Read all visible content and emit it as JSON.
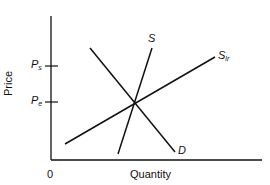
{
  "diagram": {
    "axes": {
      "y_label": "Price",
      "x_label": "Quantity",
      "origin_label": "0"
    },
    "price_levels": [
      {
        "main": "P",
        "sub": "s"
      },
      {
        "main": "P",
        "sub": "e"
      }
    ],
    "curves": [
      {
        "main": "S",
        "sub": ""
      },
      {
        "main": "S",
        "sub": "lr"
      },
      {
        "main": "D",
        "sub": ""
      }
    ]
  }
}
